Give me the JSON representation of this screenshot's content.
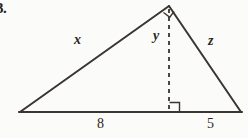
{
  "problem": {
    "number": "3."
  },
  "figure": {
    "type": "right-triangle-with-altitude",
    "colors": {
      "stroke": "#3a3530",
      "background": "#fbfbf9",
      "text": "#2a2622"
    },
    "vertices": {
      "left": [
        20,
        112
      ],
      "apex": [
        169,
        6
      ],
      "right": [
        241,
        112
      ],
      "foot": [
        169,
        112
      ]
    },
    "labels": {
      "side_x": "x",
      "side_y": "y",
      "side_z": "z"
    },
    "base_segments": {
      "left_value": "8",
      "right_value": "5"
    },
    "right_angle_markers": [
      {
        "name": "apex-right-angle",
        "at": "apex"
      },
      {
        "name": "foot-right-angle",
        "at": "foot"
      }
    ],
    "altitude": {
      "style": "dashed",
      "label": "y"
    }
  }
}
